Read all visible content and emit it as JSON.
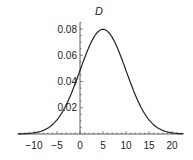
{
  "chart_data": {
    "type": "line",
    "title": "D",
    "xlabel": "",
    "ylabel": "",
    "xlim": [
      -13.5,
      22.5
    ],
    "ylim": [
      0,
      0.085
    ],
    "x_ticks": [
      -10,
      -5,
      0,
      5,
      10,
      15,
      20
    ],
    "x_tick_labels": [
      "−10",
      "−5",
      "0",
      "5",
      "10",
      "15",
      "20"
    ],
    "y_ticks": [
      0.02,
      0.04,
      0.06,
      0.08
    ],
    "y_tick_labels": [
      "0.02",
      "0.04",
      "0.06",
      "0.08"
    ],
    "grid": false,
    "legend": null,
    "series": [
      {
        "name": "D",
        "distribution": "normal",
        "mean": 5,
        "sd": 5,
        "x": [
          -13,
          -10,
          -7.5,
          -5,
          -2.5,
          0,
          2.5,
          5,
          7.5,
          10,
          12.5,
          15,
          17.5,
          20,
          22
        ],
        "y": [
          0.0006,
          0.0009,
          0.0035,
          0.0108,
          0.026,
          0.0484,
          0.0704,
          0.0798,
          0.0704,
          0.0484,
          0.026,
          0.0108,
          0.0035,
          0.0009,
          0.0002
        ]
      }
    ],
    "line_color": "#222222",
    "axis_color": "#333333"
  }
}
